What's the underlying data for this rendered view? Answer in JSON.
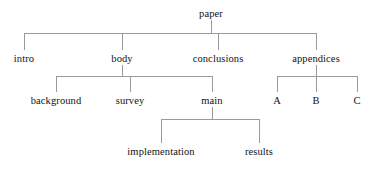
{
  "diagram": {
    "kind": "tree-diagram",
    "title_node": "paper",
    "line_color": "#9a9a9a",
    "text_color": "#121212",
    "background_color": "#ffffff",
    "nodes": {
      "root": {
        "label": "paper",
        "x": 211,
        "y": 14
      },
      "intro": {
        "label": "intro",
        "x": 24,
        "y": 59
      },
      "body": {
        "label": "body",
        "x": 122,
        "y": 59
      },
      "conclusions": {
        "label": "conclusions",
        "x": 218,
        "y": 59
      },
      "appendices": {
        "label": "appendices",
        "x": 316,
        "y": 59
      },
      "background": {
        "label": "background",
        "x": 56,
        "y": 101
      },
      "survey": {
        "label": "survey",
        "x": 130,
        "y": 101
      },
      "main": {
        "label": "main",
        "x": 212,
        "y": 101
      },
      "appendix_a": {
        "label": "A",
        "x": 277,
        "y": 101
      },
      "appendix_b": {
        "label": "B",
        "x": 316,
        "y": 101
      },
      "appendix_c": {
        "label": "C",
        "x": 357,
        "y": 101
      },
      "implementation": {
        "label": "implementation",
        "x": 161,
        "y": 152
      },
      "results": {
        "label": "results",
        "x": 259,
        "y": 152
      }
    },
    "hierarchy": {
      "paper": [
        "intro",
        "body",
        "conclusions",
        "appendices"
      ],
      "body": [
        "background",
        "survey",
        "main"
      ],
      "appendices": [
        "A",
        "B",
        "C"
      ],
      "main": [
        "implementation",
        "results"
      ]
    },
    "connectors": [
      {
        "name": "paper-to-level2",
        "stub_x": 211,
        "stub_from_y": 20,
        "bus_y": 33,
        "bus_x1": 24,
        "bus_x2": 316,
        "drops": [
          24,
          122,
          218,
          316
        ],
        "drop_to_y": 50
      },
      {
        "name": "body-to-level3",
        "stub_x": 122,
        "stub_from_y": 65,
        "bus_y": 76,
        "bus_x1": 56,
        "bus_x2": 212,
        "drops": [
          56,
          130,
          212
        ],
        "drop_to_y": 92
      },
      {
        "name": "appendices-to-letters",
        "stub_x": 316,
        "stub_from_y": 65,
        "bus_y": 76,
        "bus_x1": 277,
        "bus_x2": 357,
        "drops": [
          277,
          316,
          357
        ],
        "drop_to_y": 92
      },
      {
        "name": "main-to-level4",
        "stub_x": 212,
        "stub_from_y": 107,
        "bus_y": 119,
        "bus_x1": 161,
        "bus_x2": 259,
        "drops": [
          161,
          259
        ],
        "drop_to_y": 143
      }
    ]
  }
}
